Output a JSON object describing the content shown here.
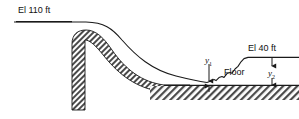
{
  "figure": {
    "kind": "engineering-diagram",
    "background_color": "#ffffff",
    "line_color": "#1a1a1a",
    "hatch_color": "#3a3a3a"
  },
  "labels": {
    "upstream_elevation": "El 110 ft",
    "downstream_elevation": "El 40 ft",
    "floor": "Floor",
    "depth_1_symbol": "y",
    "depth_1_subscript": "1",
    "depth_2_symbol": "y",
    "depth_2_subscript": "2"
  },
  "annotations": {
    "upstream_water_surface": "El 110 ft",
    "downstream_water_surface": "El 40 ft",
    "basin_floor": "Floor",
    "supercritical_depth": "y1",
    "sequent_depth": "y2"
  },
  "geometry": {
    "upstream_surface_y": 22,
    "downstream_surface_y": 57,
    "floor_y": 85,
    "crest_x": 86,
    "wall_left_x": 72,
    "wall_right_x": 85,
    "wall_bottom_y": 110,
    "jump_start_x": 207,
    "jump_end_x": 243,
    "y1_arrow_x": 209,
    "y2_arrow_x": 272
  }
}
